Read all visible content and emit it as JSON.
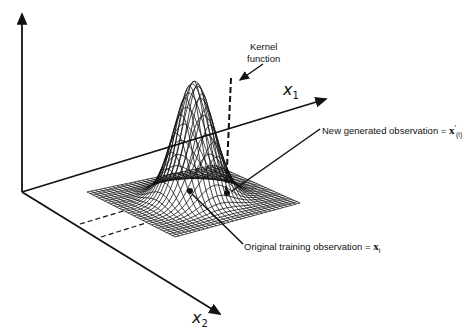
{
  "figure": {
    "axes": {
      "x1_label": "x",
      "x1_sub": "1",
      "x2_label": "x",
      "x2_sub": "2"
    },
    "annotations": {
      "kernel_line1": "Kernel",
      "kernel_line2": "function",
      "new_obs_text": "New generated  observation = ",
      "new_obs_symbol": "x",
      "new_obs_sup": "′",
      "new_obs_sub": "(i)",
      "orig_obs_text": "Original training  observation = ",
      "orig_obs_symbol": "x",
      "orig_obs_sub": "i"
    },
    "colors": {
      "ink": "#111111",
      "background": "#ffffff"
    }
  }
}
